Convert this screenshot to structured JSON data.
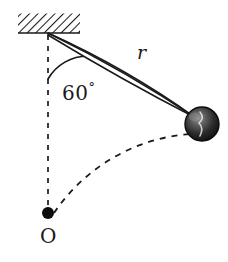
{
  "figure": {
    "name": "pendulum-diagram",
    "background_color": "#ffffff",
    "stroke_color": "#1a1a1a",
    "width": 228,
    "height": 262
  },
  "labels": {
    "angle_value": "60",
    "degree_symbol": "°",
    "radius": "r",
    "origin": "O"
  },
  "geometry": {
    "pivot": {
      "x": 48,
      "y": 33
    },
    "bob_center": {
      "x": 202,
      "y": 124
    },
    "bob_radius": 17,
    "origin_point": {
      "x": 48,
      "y": 213
    },
    "origin_dot_radius": 6,
    "rod_length": 180,
    "angle_degrees": 60,
    "angle_arc_radius": 46
  },
  "ceiling": {
    "name": "hatched-support",
    "x": 18,
    "y": 13,
    "width": 62,
    "height": 20,
    "hatch_angle_degrees": 45,
    "hatch_spacing": 4.2
  },
  "colors": {
    "ink": "#1a1a1a",
    "bob_dark": "#0d0d0d",
    "bob_mid": "#4a4a4a",
    "bob_light": "#9a9a9a",
    "paper": "#ffffff"
  }
}
